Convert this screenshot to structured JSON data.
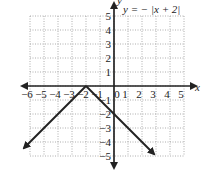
{
  "chart_data": {
    "type": "line",
    "title": "y = − |x + 2|",
    "xlabel": "x",
    "ylabel": "y",
    "xlim": [
      -6,
      5
    ],
    "ylim": [
      -5,
      5
    ],
    "grid": true,
    "x_ticks": [
      "−6",
      "−5",
      "−4",
      "−3",
      "−2",
      "−1",
      "0",
      "1",
      "2",
      "3",
      "4",
      "5"
    ],
    "y_ticks": [
      "5",
      "4",
      "3",
      "2",
      "1",
      "−1",
      "−2",
      "−3",
      "−4",
      "−5"
    ],
    "series": [
      {
        "name": "y = −|x + 2|",
        "points": [
          [
            -6.5,
            -4.5
          ],
          [
            -2,
            0
          ],
          [
            2.9,
            -4.9
          ]
        ],
        "arrows_both_ends": true
      }
    ],
    "vertex": [
      -2,
      0
    ],
    "y_intercept": [
      0,
      -2
    ]
  }
}
